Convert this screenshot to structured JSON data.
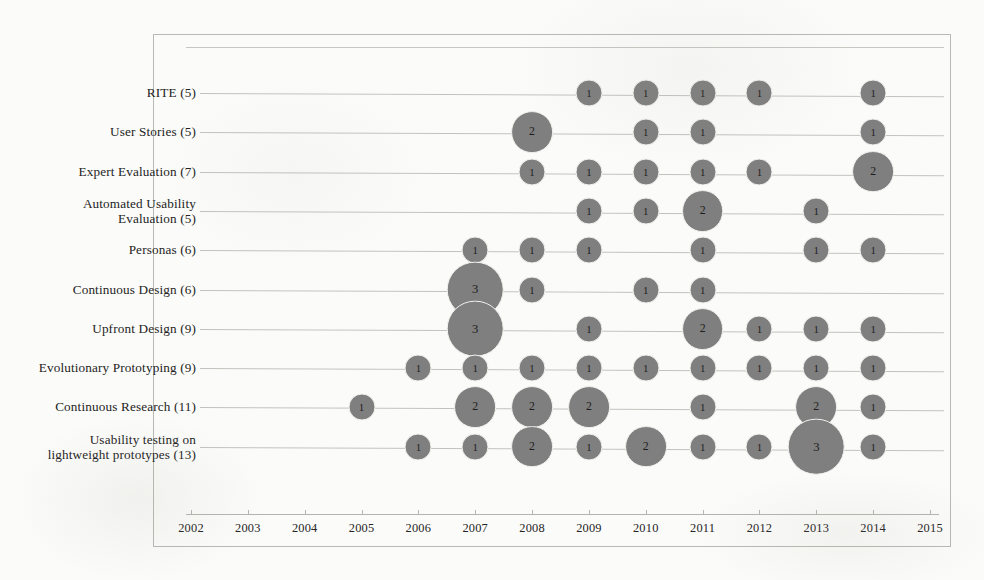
{
  "chart_data": {
    "type": "bubble",
    "title": "",
    "xlabel": "",
    "ylabel": "",
    "xlim": [
      2002,
      2015
    ],
    "grid": true,
    "legend": "none",
    "bubble_color": "#7f7f7f",
    "x": [
      2002,
      2003,
      2004,
      2005,
      2006,
      2007,
      2008,
      2009,
      2010,
      2011,
      2012,
      2013,
      2014,
      2015
    ],
    "xtick_labels": [
      "2002",
      "2003",
      "2004",
      "2005",
      "2006",
      "2007",
      "2008",
      "2009",
      "2010",
      "2011",
      "2012",
      "2013",
      "2014",
      "2015"
    ],
    "categories": [
      "RITE (5)",
      "User Stories (5)",
      "Expert Evaluation (7)",
      "Automated Usability\nEvaluation (5)",
      "Personas (6)",
      "Continuous Design (6)",
      "Upfront Design (9)",
      "Evolutionary Prototyping (9)",
      "Continuous Research (11)",
      "Usability testing on\nlightweight prototypes (13)"
    ],
    "series": [
      {
        "name": "RITE (5)",
        "total": 5,
        "points": [
          {
            "year": 2009,
            "value": 1
          },
          {
            "year": 2010,
            "value": 1
          },
          {
            "year": 2011,
            "value": 1
          },
          {
            "year": 2012,
            "value": 1
          },
          {
            "year": 2014,
            "value": 1
          }
        ]
      },
      {
        "name": "User Stories (5)",
        "total": 5,
        "points": [
          {
            "year": 2008,
            "value": 2
          },
          {
            "year": 2010,
            "value": 1
          },
          {
            "year": 2011,
            "value": 1
          },
          {
            "year": 2014,
            "value": 1
          }
        ]
      },
      {
        "name": "Expert Evaluation (7)",
        "total": 7,
        "points": [
          {
            "year": 2008,
            "value": 1
          },
          {
            "year": 2009,
            "value": 1
          },
          {
            "year": 2010,
            "value": 1
          },
          {
            "year": 2011,
            "value": 1
          },
          {
            "year": 2012,
            "value": 1
          },
          {
            "year": 2014,
            "value": 2
          }
        ]
      },
      {
        "name": "Automated Usability\nEvaluation (5)",
        "total": 5,
        "points": [
          {
            "year": 2009,
            "value": 1
          },
          {
            "year": 2010,
            "value": 1
          },
          {
            "year": 2011,
            "value": 2
          },
          {
            "year": 2013,
            "value": 1
          }
        ]
      },
      {
        "name": "Personas (6)",
        "total": 6,
        "points": [
          {
            "year": 2007,
            "value": 1
          },
          {
            "year": 2008,
            "value": 1
          },
          {
            "year": 2009,
            "value": 1
          },
          {
            "year": 2011,
            "value": 1
          },
          {
            "year": 2013,
            "value": 1
          },
          {
            "year": 2014,
            "value": 1
          }
        ]
      },
      {
        "name": "Continuous Design (6)",
        "total": 6,
        "points": [
          {
            "year": 2007,
            "value": 3
          },
          {
            "year": 2008,
            "value": 1
          },
          {
            "year": 2010,
            "value": 1
          },
          {
            "year": 2011,
            "value": 1
          }
        ]
      },
      {
        "name": "Upfront Design (9)",
        "total": 9,
        "points": [
          {
            "year": 2007,
            "value": 3
          },
          {
            "year": 2009,
            "value": 1
          },
          {
            "year": 2011,
            "value": 2
          },
          {
            "year": 2012,
            "value": 1
          },
          {
            "year": 2013,
            "value": 1
          },
          {
            "year": 2014,
            "value": 1
          }
        ]
      },
      {
        "name": "Evolutionary Prototyping (9)",
        "total": 9,
        "points": [
          {
            "year": 2006,
            "value": 1
          },
          {
            "year": 2007,
            "value": 1
          },
          {
            "year": 2008,
            "value": 1
          },
          {
            "year": 2009,
            "value": 1
          },
          {
            "year": 2010,
            "value": 1
          },
          {
            "year": 2011,
            "value": 1
          },
          {
            "year": 2012,
            "value": 1
          },
          {
            "year": 2013,
            "value": 1
          },
          {
            "year": 2014,
            "value": 1
          }
        ]
      },
      {
        "name": "Continuous Research (11)",
        "total": 11,
        "points": [
          {
            "year": 2005,
            "value": 1
          },
          {
            "year": 2007,
            "value": 2
          },
          {
            "year": 2008,
            "value": 2
          },
          {
            "year": 2009,
            "value": 2
          },
          {
            "year": 2011,
            "value": 1
          },
          {
            "year": 2013,
            "value": 2
          },
          {
            "year": 2014,
            "value": 1
          }
        ]
      },
      {
        "name": "Usability testing on\nlightweight prototypes (13)",
        "total": 13,
        "points": [
          {
            "year": 2006,
            "value": 1
          },
          {
            "year": 2007,
            "value": 1
          },
          {
            "year": 2008,
            "value": 2
          },
          {
            "year": 2009,
            "value": 1
          },
          {
            "year": 2010,
            "value": 2
          },
          {
            "year": 2011,
            "value": 1
          },
          {
            "year": 2012,
            "value": 1
          },
          {
            "year": 2013,
            "value": 3
          },
          {
            "year": 2014,
            "value": 1
          }
        ]
      }
    ]
  },
  "layout": {
    "frame": {
      "left": 153,
      "top": 34,
      "width": 798,
      "height": 513
    },
    "plot": {
      "x0": 191,
      "x1": 930,
      "y0": 93,
      "row_gap": 39.3
    },
    "axis_y": 514,
    "tick_label_y": 521,
    "label_right": 196,
    "top_rule": {
      "x0": 186,
      "x1": 944,
      "y": 47
    }
  }
}
